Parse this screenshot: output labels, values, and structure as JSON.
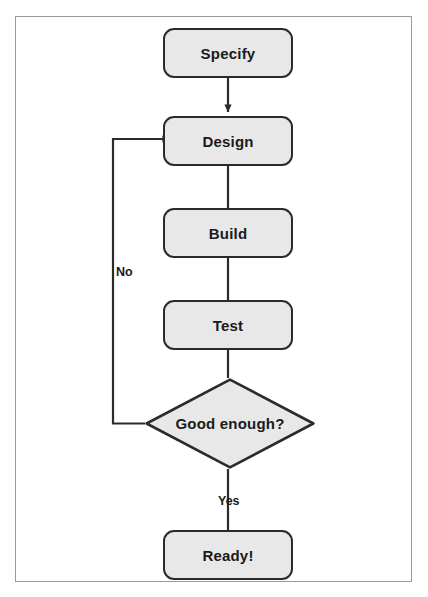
{
  "figure": {
    "caption": "",
    "frame_color": "#9a9a9a",
    "background": "#ffffff"
  },
  "style": {
    "node_fill": "#e8e8e8",
    "node_stroke": "#2b2b2b",
    "connector_color": "#2b2b2b",
    "text_color": "#1a1a1a"
  },
  "flowchart": {
    "type": "flowchart",
    "orientation": "vertical",
    "nodes": [
      {
        "id": "specify",
        "label": "Specify",
        "shape": "rounded-rectangle"
      },
      {
        "id": "design",
        "label": "Design",
        "shape": "rounded-rectangle"
      },
      {
        "id": "build",
        "label": "Build",
        "shape": "rounded-rectangle"
      },
      {
        "id": "test",
        "label": "Test",
        "shape": "rounded-rectangle"
      },
      {
        "id": "decision",
        "label": "Good enough?",
        "shape": "diamond"
      },
      {
        "id": "ready",
        "label": "Ready!",
        "shape": "rounded-rectangle"
      }
    ],
    "edges": [
      {
        "from": "specify",
        "to": "design",
        "label": "",
        "arrow": true
      },
      {
        "from": "design",
        "to": "build",
        "label": "",
        "arrow": false
      },
      {
        "from": "build",
        "to": "test",
        "label": "",
        "arrow": false
      },
      {
        "from": "test",
        "to": "decision",
        "label": "",
        "arrow": false
      },
      {
        "from": "decision",
        "to": "design",
        "label": "No",
        "arrow": true
      },
      {
        "from": "decision",
        "to": "ready",
        "label": "Yes",
        "arrow": false
      }
    ],
    "edge_labels": {
      "no": "No",
      "yes": "Yes"
    }
  }
}
